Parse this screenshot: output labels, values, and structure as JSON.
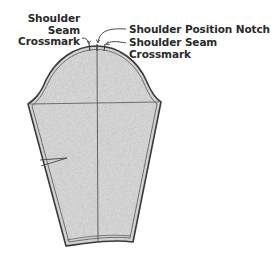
{
  "diagram": {
    "colors": {
      "outline": "#3a3a3a",
      "fill": "#c8c8c8",
      "fill_speckle": "#9a9a9a",
      "text": "#2a2a2a",
      "background": "#ffffff"
    },
    "labels": {
      "left_crossmark": {
        "line1": "Shoulder",
        "line2": "Seam",
        "line3": "Crossmark"
      },
      "position_notch": "Shoulder Position Notch",
      "right_crossmark": {
        "line1": "Shoulder Seam",
        "line2": "Crossmark"
      }
    },
    "features": [
      "sleeve-cap",
      "grainline",
      "biceps-line",
      "elbow-dart",
      "hem-allowance",
      "seam-allowance"
    ]
  }
}
